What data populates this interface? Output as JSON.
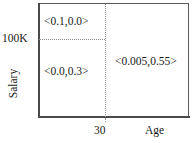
{
  "figure": {
    "type": "2d-partition-diagram",
    "background_color": "#ffffff",
    "line_color": "#4a4a4a",
    "dotted_line_color": "#8c8c8c",
    "text_color": "#1a1a1a"
  },
  "axes": {
    "x": {
      "title": "Age",
      "ticks": [
        "30"
      ]
    },
    "y": {
      "title": "Salary",
      "ticks": [
        "100K"
      ]
    }
  },
  "regions": [
    {
      "id": "top-left",
      "label": "<0.1,0.0>",
      "description": "Age below 30, Salary above 100K"
    },
    {
      "id": "bottom-left",
      "label": "<0.0,0.3>",
      "description": "Age below 30, Salary below 100K"
    },
    {
      "id": "right",
      "label": "<0.005,0.55>",
      "description": "Age above 30"
    }
  ],
  "chart_data": {
    "type": "table",
    "title": "",
    "xlabel": "Age",
    "ylabel": "Salary",
    "x_ticks": [
      "30"
    ],
    "y_ticks": [
      "100K"
    ],
    "split_x": "30",
    "split_y": "100K",
    "grid": false,
    "legend": "none",
    "cells": [
      {
        "region": "top-left",
        "x_range": "< 30",
        "y_range": "> 100K",
        "value": "<0.1,0.0>"
      },
      {
        "region": "bottom-left",
        "x_range": "< 30",
        "y_range": "< 100K",
        "value": "<0.0,0.3>"
      },
      {
        "region": "right",
        "x_range": "> 30",
        "y_range": "all",
        "value": "<0.005,0.55>"
      }
    ]
  }
}
